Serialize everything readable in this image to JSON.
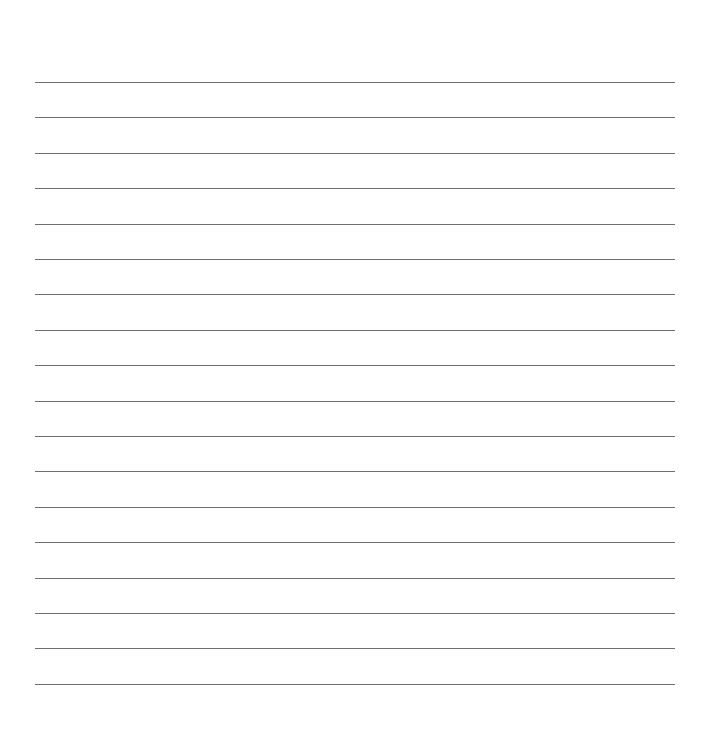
{
  "page": {
    "type": "lined-paper",
    "background_color": "#ffffff",
    "line_color": "#6e6e6e",
    "line_count": 18,
    "first_line_y": 82,
    "line_spacing": 35.4,
    "line_left": 35,
    "line_width": 640
  }
}
